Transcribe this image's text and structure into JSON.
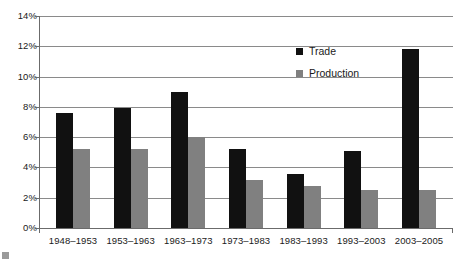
{
  "chart_data": {
    "type": "bar",
    "title": "",
    "subtitle": "",
    "xlabel": "",
    "ylabel": "",
    "ylim": [
      0,
      14
    ],
    "y_ticks": [
      "0%",
      "2%",
      "4%",
      "6%",
      "8%",
      "10%",
      "12%",
      "14%"
    ],
    "y_tick_values": [
      0,
      2,
      4,
      6,
      8,
      10,
      12,
      14
    ],
    "grid": true,
    "legend_position": "top-center-right",
    "categories": [
      "1948–1953",
      "1953–1963",
      "1963–1973",
      "1973–1983",
      "1983–1993",
      "1993–2003",
      "2003–2005"
    ],
    "series": [
      {
        "name": "Trade",
        "color": "#111111",
        "values": [
          7.6,
          7.9,
          9.0,
          5.2,
          3.6,
          5.1,
          11.8
        ]
      },
      {
        "name": "Production",
        "color": "#808080",
        "values": [
          5.2,
          5.2,
          6.0,
          3.2,
          2.8,
          2.5,
          2.5
        ]
      }
    ]
  },
  "legend": {
    "items": [
      {
        "label": "Trade",
        "color": "#111111"
      },
      {
        "label": "Production",
        "color": "#808080"
      }
    ]
  },
  "axis": {
    "grid_color": "#8a8a8a",
    "axis_color": "#6b6b6b"
  }
}
